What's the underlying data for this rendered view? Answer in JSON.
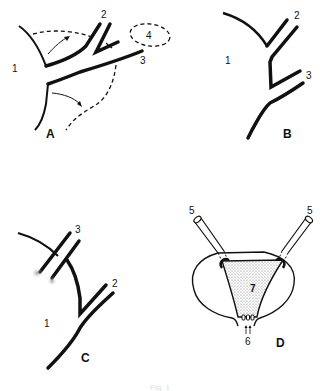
{
  "figure": {
    "caption": "Fig. 1",
    "panels": [
      {
        "id": "A",
        "label": "A",
        "numbers": [
          "1",
          "2",
          "3",
          "4"
        ],
        "elements": [
          "vessel-wall",
          "branch-2",
          "branch-3",
          "dashed-outline-4",
          "dashed-flap",
          "curved-arrows"
        ]
      },
      {
        "id": "B",
        "label": "B",
        "numbers": [
          "1",
          "2",
          "3"
        ],
        "elements": [
          "vessel-wall",
          "branch-2",
          "branch-3"
        ]
      },
      {
        "id": "C",
        "label": "C",
        "numbers": [
          "1",
          "2",
          "3"
        ],
        "elements": [
          "vessel-wall",
          "branch-2",
          "branch-3-ligated"
        ]
      },
      {
        "id": "D",
        "label": "D",
        "numbers": [
          "5",
          "5",
          "6",
          "7"
        ],
        "elements": [
          "tube-left",
          "tube-right",
          "bladder-outline",
          "stippled-trigone",
          "orifices"
        ]
      }
    ]
  }
}
